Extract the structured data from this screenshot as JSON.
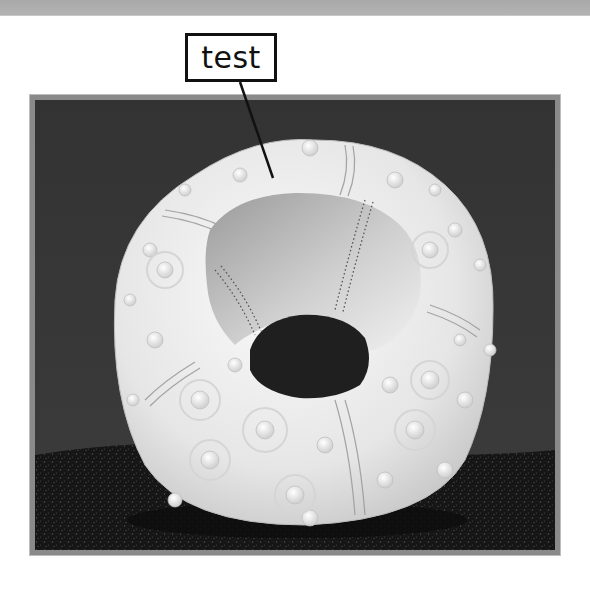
{
  "annotation": {
    "label": "test",
    "line_start": [
      240,
      82
    ],
    "line_end": [
      273,
      178
    ]
  },
  "photo": {
    "subject": "sea urchin test (shell) on black sand",
    "icon": "photo-image"
  },
  "colors": {
    "backdrop": "#3a3a3a",
    "sand": "#1a1a1a",
    "shell": "#ececec",
    "frame": "#8a8a8a",
    "top_strip": "#aaaaaa"
  }
}
